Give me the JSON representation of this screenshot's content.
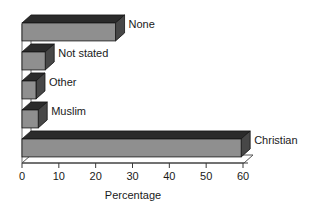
{
  "chart_data": {
    "type": "bar",
    "orientation": "horizontal",
    "style": "3d",
    "title": "",
    "subtitle": "",
    "xlabel": "Percentage",
    "ylabel": "",
    "categories": [
      "Christian",
      "Muslim",
      "Other",
      "Not stated",
      "None"
    ],
    "values": [
      59.5,
      4.4,
      3.8,
      6.3,
      25.4
    ],
    "series": [
      {
        "name": "Percentage",
        "values": [
          59.5,
          4.4,
          3.8,
          6.3,
          25.4
        ]
      }
    ],
    "xlim": [
      0,
      60
    ],
    "xticks": [
      0,
      10,
      20,
      30,
      40,
      50,
      60
    ],
    "xtick_labels": [
      "0",
      "10",
      "20",
      "30",
      "40",
      "50",
      "60"
    ],
    "grid": false,
    "legend": "none",
    "bar_face_color": "#8f8f8f",
    "bar_top_color": "#2b2b2b",
    "bar_side_color": "#474747",
    "axis_color": "#3a3a3a",
    "text_color": "#1a1a1a",
    "background_color": "#ffffff"
  },
  "axis": {
    "x_title": "Percentage",
    "ticks": [
      {
        "value": 0,
        "label": "0"
      },
      {
        "value": 10,
        "label": "10"
      },
      {
        "value": 20,
        "label": "20"
      },
      {
        "value": 30,
        "label": "30"
      },
      {
        "value": 40,
        "label": "40"
      },
      {
        "value": 50,
        "label": "50"
      },
      {
        "value": 60,
        "label": "60"
      }
    ]
  },
  "bars": [
    {
      "label": "None",
      "value": 25.4
    },
    {
      "label": "Not stated",
      "value": 6.3
    },
    {
      "label": "Other",
      "value": 3.8
    },
    {
      "label": "Muslim",
      "value": 4.4
    },
    {
      "label": "Christian",
      "value": 59.5
    }
  ]
}
